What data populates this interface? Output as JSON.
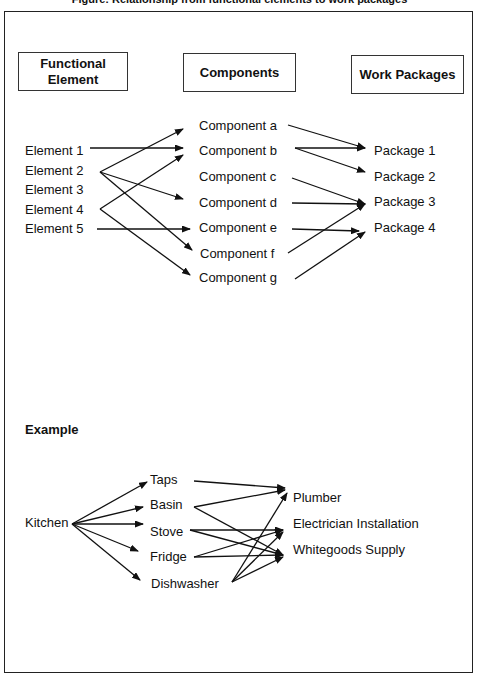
{
  "title": "Figure: Relationship from functional elements to work packages",
  "headers": {
    "functional_element": "Functional Element",
    "components": "Components",
    "work_packages": "Work Packages"
  },
  "elements": [
    "Element 1",
    "Element 2",
    "Element 3",
    "Element 4",
    "Element 5"
  ],
  "components": [
    "Component a",
    "Component b",
    "Component c",
    "Component d",
    "Component e",
    "Component f",
    "Component g"
  ],
  "packages": [
    "Package 1",
    "Package 2",
    "Package 3",
    "Package 4"
  ],
  "element_to_component_links": [
    [
      "Element 1",
      "Component b"
    ],
    [
      "Element 2",
      "Component a"
    ],
    [
      "Element 2",
      "Component d"
    ],
    [
      "Element 2",
      "Component f"
    ],
    [
      "Element 4",
      "Component b"
    ],
    [
      "Element 4",
      "Component g"
    ],
    [
      "Element 5",
      "Component e"
    ]
  ],
  "component_to_package_links": [
    [
      "Component a",
      "Package 1"
    ],
    [
      "Component b",
      "Package 1"
    ],
    [
      "Component b",
      "Package 2"
    ],
    [
      "Component c",
      "Package 3"
    ],
    [
      "Component d",
      "Package 3"
    ],
    [
      "Component e",
      "Package 4"
    ],
    [
      "Component f",
      "Package 3"
    ],
    [
      "Component g",
      "Package 4"
    ]
  ],
  "example": {
    "heading": "Example",
    "root": "Kitchen",
    "items": [
      "Taps",
      "Basin",
      "Stove",
      "Fridge",
      "Dishwasher"
    ],
    "trades": [
      "Plumber",
      "Electrician Installation",
      "Whitegoods Supply"
    ],
    "item_to_trade_links": [
      [
        "Taps",
        "Plumber"
      ],
      [
        "Basin",
        "Plumber"
      ],
      [
        "Basin",
        "Whitegoods Supply"
      ],
      [
        "Stove",
        "Electrician Installation"
      ],
      [
        "Stove",
        "Whitegoods Supply"
      ],
      [
        "Fridge",
        "Electrician Installation"
      ],
      [
        "Fridge",
        "Whitegoods Supply"
      ],
      [
        "Dishwasher",
        "Plumber"
      ],
      [
        "Dishwasher",
        "Electrician Installation"
      ],
      [
        "Dishwasher",
        "Whitegoods Supply"
      ]
    ]
  }
}
